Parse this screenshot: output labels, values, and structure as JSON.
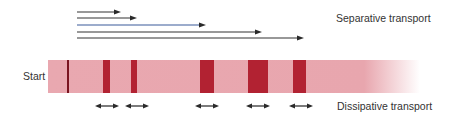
{
  "labels": {
    "separative": "Separative transport",
    "dissipative": "Dissipative transport",
    "start": "Start"
  },
  "colors": {
    "strip": "#e8a6ae",
    "band": "#b22232",
    "start_line": "#7a1420",
    "arrow": "#333333",
    "highlight_arrow": "#3a5a9a"
  },
  "separative_arrows": [
    {
      "y": 12,
      "x_start": 77,
      "x_end": 121,
      "color": "#333333"
    },
    {
      "y": 18,
      "x_start": 77,
      "x_end": 137,
      "color": "#333333"
    },
    {
      "y": 25,
      "x_start": 77,
      "x_end": 206,
      "color": "#3a5a9a"
    },
    {
      "y": 32,
      "x_start": 77,
      "x_end": 262,
      "color": "#333333"
    },
    {
      "y": 38,
      "x_start": 77,
      "x_end": 304,
      "color": "#333333"
    }
  ],
  "strip": {
    "x": 48,
    "y": 60,
    "width": 372,
    "height": 33
  },
  "start_line_x": 67,
  "bands": [
    {
      "x": 103,
      "width": 7
    },
    {
      "x": 131,
      "width": 6
    },
    {
      "x": 200,
      "width": 14
    },
    {
      "x": 248,
      "width": 20
    },
    {
      "x": 293,
      "width": 13
    }
  ],
  "dissipative_arrows": [
    {
      "cx": 107,
      "half_width": 12,
      "y": 106
    },
    {
      "cx": 137,
      "half_width": 12,
      "y": 106
    },
    {
      "cx": 207,
      "half_width": 12,
      "y": 106
    },
    {
      "cx": 258,
      "half_width": 12,
      "y": 106
    },
    {
      "cx": 301,
      "half_width": 12,
      "y": 106
    }
  ]
}
